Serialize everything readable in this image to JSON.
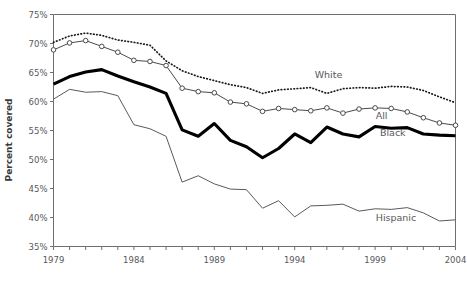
{
  "chart_data": {
    "type": "line",
    "title": "",
    "xlabel": "",
    "ylabel": "Percent covered",
    "xlim": [
      1979,
      2004
    ],
    "ylim": [
      35,
      75
    ],
    "yticks": [
      35,
      40,
      45,
      50,
      55,
      60,
      65,
      70,
      75
    ],
    "ytick_labels": [
      "35%",
      "40%",
      "45%",
      "50%",
      "55%",
      "60%",
      "65%",
      "70%",
      "75%"
    ],
    "xticks": [
      1979,
      1980,
      1981,
      1982,
      1983,
      1984,
      1985,
      1986,
      1987,
      1988,
      1989,
      1990,
      1991,
      1992,
      1993,
      1994,
      1995,
      1996,
      1997,
      1998,
      1999,
      2000,
      2001,
      2002,
      2003,
      2004
    ],
    "xtick_labels_shown": [
      "1979",
      "1984",
      "1989",
      "1994",
      "1999",
      "2004"
    ],
    "grid": false,
    "legend_position": "inline-annotations",
    "x": [
      1979,
      1980,
      1981,
      1982,
      1983,
      1984,
      1985,
      1986,
      1987,
      1988,
      1989,
      1990,
      1991,
      1992,
      1993,
      1994,
      1995,
      1996,
      1997,
      1998,
      1999,
      2000,
      2001,
      2002,
      2003,
      2004
    ],
    "series": [
      {
        "name": "White",
        "style": "dotted",
        "color": "#1a1a1a",
        "label_x": 1996.1,
        "label_y": 64.1,
        "values": [
          70.2,
          71.3,
          71.8,
          71.4,
          70.6,
          70.2,
          69.7,
          67.0,
          65.3,
          64.3,
          63.6,
          62.9,
          62.4,
          61.4,
          62.0,
          62.2,
          62.4,
          61.4,
          62.2,
          62.4,
          62.3,
          62.6,
          62.5,
          61.9,
          60.8,
          59.8
        ]
      },
      {
        "name": "All",
        "style": "solid-markers",
        "color": "#4a4a4c",
        "label_x": 1999.4,
        "label_y": 57.0,
        "values": [
          68.9,
          70.1,
          70.5,
          69.5,
          68.5,
          67.1,
          66.9,
          66.2,
          62.3,
          61.7,
          61.5,
          59.9,
          59.6,
          58.3,
          58.8,
          58.6,
          58.4,
          58.9,
          58.0,
          58.7,
          58.9,
          58.8,
          58.2,
          57.2,
          56.3,
          55.9
        ]
      },
      {
        "name": "Black",
        "style": "thick-solid",
        "color": "#000000",
        "label_x": 2000.1,
        "label_y": 54.0,
        "values": [
          63.0,
          64.3,
          65.1,
          65.5,
          64.4,
          63.4,
          62.5,
          61.4,
          55.1,
          54.0,
          56.2,
          53.3,
          52.2,
          50.3,
          51.9,
          54.4,
          52.9,
          55.6,
          54.4,
          53.9,
          55.7,
          55.4,
          55.5,
          54.4,
          54.2,
          54.1
        ]
      },
      {
        "name": "Hispanic",
        "style": "thin-solid",
        "color": "#5a5a5c",
        "label_x": 2000.3,
        "label_y": 39.4,
        "values": [
          60.4,
          62.1,
          61.6,
          61.7,
          61.0,
          56.0,
          55.3,
          54.0,
          46.1,
          47.2,
          45.8,
          44.9,
          44.8,
          41.6,
          42.9,
          40.1,
          42.0,
          42.1,
          42.3,
          41.1,
          41.5,
          41.4,
          41.7,
          40.8,
          39.4,
          39.6
        ]
      }
    ]
  }
}
